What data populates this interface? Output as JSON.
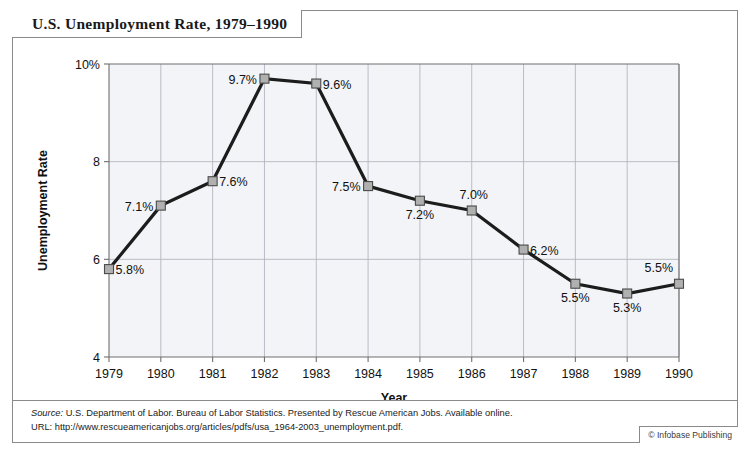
{
  "figure": {
    "title": "U.S. Unemployment Rate, 1979–1990",
    "source_label": "Source:",
    "source_text": " U.S. Department of Labor. Bureau of Labor Statistics. Presented by Rescue American Jobs. Available online.",
    "url_line": "URL: http://www.rescueamericanjobs.org/articles/pdfs/usa_1964-2003_unemployment.pdf.",
    "credit": "© Infobase Publishing"
  },
  "chart_data": {
    "type": "line",
    "title": "U.S. Unemployment Rate, 1979–1990",
    "xlabel": "Year",
    "ylabel": "Unemployment Rate",
    "categories": [
      1979,
      1980,
      1981,
      1982,
      1983,
      1984,
      1985,
      1986,
      1987,
      1988,
      1989,
      1990
    ],
    "x_tick_labels": [
      "1979",
      "1980",
      "1981",
      "1982",
      "1983",
      "1984",
      "1985",
      "1986",
      "1987",
      "1988",
      "1989",
      "1990"
    ],
    "values": [
      5.8,
      7.1,
      7.6,
      9.7,
      9.6,
      7.5,
      7.2,
      7.0,
      6.2,
      5.5,
      5.3,
      5.5
    ],
    "point_labels": [
      "5.8%",
      "7.1%",
      "7.6%",
      "9.7%",
      "9.6%",
      "7.5%",
      "7.2%",
      "7.0%",
      "6.2%",
      "5.5%",
      "5.3%",
      "5.5%"
    ],
    "label_positions": [
      "right",
      "left",
      "right",
      "left",
      "right",
      "left",
      "below",
      "above-right",
      "right",
      "below",
      "below",
      "above-left"
    ],
    "ylim": [
      4,
      10
    ],
    "y_ticks": [
      4,
      6,
      8,
      10
    ],
    "y_tick_labels": [
      "4",
      "6",
      "8",
      "10%"
    ],
    "grid": true,
    "legend": "none",
    "line_color": "#1c1c1c",
    "marker_color": "#b0b0b0",
    "plot_background": "#f2f4f7"
  }
}
